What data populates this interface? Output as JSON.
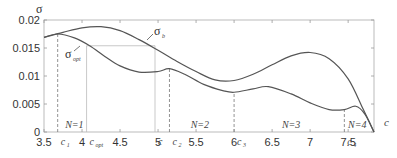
{
  "chart_data": {
    "type": "line",
    "title": "",
    "xlabel": "c",
    "ylabel": "σ",
    "xlim": [
      3.5,
      7.84
    ],
    "ylim": [
      0,
      0.02
    ],
    "xticks": [
      "3.5",
      "4",
      "4.5",
      "5",
      "5.5",
      "6",
      "6.5",
      "7",
      "7.5"
    ],
    "yticks": [
      "0",
      "0.005",
      "0.01",
      "0.015",
      "0.02"
    ],
    "grid": false,
    "series": [
      {
        "name": "σ_b",
        "label_main": "σ",
        "label_sub": "b",
        "x": [
          3.5,
          3.75,
          4.0,
          4.25,
          4.5,
          4.75,
          5.0,
          5.25,
          5.5,
          5.75,
          6.0,
          6.25,
          6.5,
          6.75,
          7.0,
          7.25,
          7.5,
          7.7,
          7.84
        ],
        "y": [
          0.0169,
          0.0178,
          0.0186,
          0.0188,
          0.0181,
          0.0165,
          0.0146,
          0.0126,
          0.0108,
          0.0093,
          0.0092,
          0.0103,
          0.012,
          0.0136,
          0.0142,
          0.0131,
          0.0095,
          0.004,
          0.0
        ]
      },
      {
        "name": "σ_opt",
        "label_main": "σ",
        "label_sub": "opt",
        "x": [
          3.5,
          3.68,
          3.9,
          4.1,
          4.3,
          4.5,
          4.75,
          5.0,
          5.15,
          5.35,
          5.6,
          5.85,
          6.0,
          6.25,
          6.45,
          6.75,
          7.0,
          7.25,
          7.45,
          7.6,
          7.72,
          7.84
        ],
        "y": [
          0.0169,
          0.0175,
          0.0168,
          0.0154,
          0.0135,
          0.0118,
          0.0107,
          0.0108,
          0.0113,
          0.0103,
          0.0085,
          0.0074,
          0.0071,
          0.0077,
          0.0081,
          0.0068,
          0.0052,
          0.004,
          0.004,
          0.0046,
          0.0032,
          0.0
        ]
      }
    ],
    "annotations": {
      "vertical_markers": [
        {
          "label": "c",
          "sub": "1",
          "x": 3.68,
          "style": "dashed",
          "y_top": 0.0175
        },
        {
          "label": "c",
          "sub": "opt",
          "x": 4.06,
          "style": "solid",
          "y_top": 0.0154
        },
        {
          "label": "c",
          "sub": "",
          "x": 4.96,
          "style": "solid",
          "y_top": 0.0154
        },
        {
          "label": "c",
          "sub": "2",
          "x": 5.15,
          "style": "dashed",
          "y_top": 0.0113
        },
        {
          "label": "c",
          "sub": "3",
          "x": 6.0,
          "style": "dashed",
          "y_top": 0.0071
        },
        {
          "label": "c",
          "sub": "4",
          "x": 7.45,
          "style": "dashed",
          "y_top": 0.004
        }
      ],
      "horizontal_marker": {
        "y": 0.0154,
        "x_from": 4.06,
        "x_to": 4.96
      },
      "regions": [
        {
          "label": "N=1",
          "x": 3.9
        },
        {
          "label": "N=2",
          "x": 5.55
        },
        {
          "label": "N=3",
          "x": 6.75
        },
        {
          "label": "N=4",
          "x": 7.62
        }
      ]
    }
  }
}
